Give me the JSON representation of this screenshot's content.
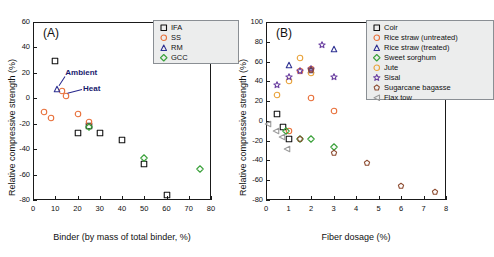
{
  "figure": {
    "panels": [
      {
        "id": "A",
        "label": "(A)",
        "xlabel": "Binder (by mass of total binder, %)",
        "ylabel": "Relative compressive strength (%)",
        "xlim": [
          0,
          80
        ],
        "ylim": [
          -80,
          60
        ],
        "xticks": [
          0,
          10,
          20,
          30,
          40,
          50,
          60,
          70,
          80
        ],
        "yticks": [
          -80,
          -60,
          -40,
          -20,
          0,
          20,
          40,
          60
        ],
        "annotations": [
          {
            "text": "Ambient",
            "x": 14.5,
            "y": 20.0
          },
          {
            "text": "Heat",
            "x": 22.5,
            "y": 7.0
          }
        ],
        "legend": [
          {
            "label": "IFA",
            "marker": "square",
            "color": "#111111"
          },
          {
            "label": "SS",
            "marker": "circle",
            "color": "#E8703A"
          },
          {
            "label": "RM",
            "marker": "triangle",
            "color": "#2E3192"
          },
          {
            "label": "GCC",
            "marker": "diamond",
            "color": "#3DA23D"
          }
        ]
      },
      {
        "id": "B",
        "label": "(B)",
        "xlabel": "Fiber dosage (%)",
        "ylabel": "Relative compressive strength (%)",
        "xlim": [
          0,
          8
        ],
        "ylim": [
          -80,
          100
        ],
        "xticks": [
          0,
          1,
          2,
          3,
          4,
          5,
          6,
          7,
          8
        ],
        "yticks": [
          -80,
          -60,
          -40,
          -20,
          0,
          20,
          40,
          60,
          80,
          100
        ],
        "annotations": [],
        "legend": [
          {
            "label": "Coir",
            "marker": "square",
            "color": "#111111"
          },
          {
            "label": "Rice straw (untreated)",
            "marker": "circle",
            "color": "#E8703A"
          },
          {
            "label": "Rice straw (treated)",
            "marker": "triangle",
            "color": "#2E3192"
          },
          {
            "label": "Sweet sorghum",
            "marker": "diamond",
            "color": "#3DA23D"
          },
          {
            "label": "Jute",
            "marker": "circle",
            "color": "#E9A33C"
          },
          {
            "label": "Sisal",
            "marker": "star",
            "color": "#6A3FA0"
          },
          {
            "label": "Sugarcane bagasse",
            "marker": "pentagon",
            "color": "#8C4A2F"
          },
          {
            "label": "Flax tow",
            "marker": "triangle-left",
            "color": "#9A9A9A"
          }
        ]
      }
    ]
  },
  "chart_data": [
    {
      "type": "scatter",
      "panel": "A",
      "title": "(A)",
      "xlabel": "Binder (by mass of total binder, %)",
      "ylabel": "Relative compressive strength (%)",
      "xlim": [
        0,
        80
      ],
      "ylim": [
        -80,
        60
      ],
      "xticks": [
        0,
        10,
        20,
        30,
        40,
        50,
        60,
        70,
        80
      ],
      "yticks": [
        -80,
        -60,
        -40,
        -20,
        0,
        20,
        40,
        60
      ],
      "grid": false,
      "legend_position": "top-right",
      "series": [
        {
          "name": "IFA",
          "marker": "square",
          "color": "#111111",
          "points": [
            {
              "x": 10,
              "y": 29
            },
            {
              "x": 20,
              "y": -27.5
            },
            {
              "x": 25,
              "y": -22
            },
            {
              "x": 30,
              "y": -27.5
            },
            {
              "x": 40,
              "y": -33
            },
            {
              "x": 50,
              "y": -52
            },
            {
              "x": 60,
              "y": -76
            }
          ]
        },
        {
          "name": "SS",
          "marker": "circle",
          "color": "#E8703A",
          "points": [
            {
              "x": 5,
              "y": -10.5
            },
            {
              "x": 8,
              "y": -15.5
            },
            {
              "x": 15,
              "y": 2
            },
            {
              "x": 20,
              "y": -12
            },
            {
              "x": 25,
              "y": -19
            },
            {
              "x": 13,
              "y": 6
            }
          ]
        },
        {
          "name": "RM",
          "marker": "triangle",
          "color": "#2E3192",
          "points": [
            {
              "x": 11,
              "y": 7
            }
          ]
        },
        {
          "name": "GCC",
          "marker": "diamond",
          "color": "#3DA23D",
          "points": [
            {
              "x": 25,
              "y": -22.5
            },
            {
              "x": 50,
              "y": -47
            },
            {
              "x": 75,
              "y": -56
            }
          ]
        }
      ],
      "annotations": [
        {
          "text": "Ambient",
          "x": 14.5,
          "y": 20.0
        },
        {
          "text": "Heat",
          "x": 22.5,
          "y": 7.0
        }
      ]
    },
    {
      "type": "scatter",
      "panel": "B",
      "title": "(B)",
      "xlabel": "Fiber dosage (%)",
      "ylabel": "Relative compressive strength (%)",
      "xlim": [
        0,
        8
      ],
      "ylim": [
        -80,
        100
      ],
      "xticks": [
        0,
        1,
        2,
        3,
        4,
        5,
        6,
        7,
        8
      ],
      "yticks": [
        -80,
        -60,
        -40,
        -20,
        0,
        20,
        40,
        60,
        80,
        100
      ],
      "grid": false,
      "legend_position": "top-right",
      "series": [
        {
          "name": "Coir",
          "marker": "square",
          "color": "#111111",
          "points": [
            {
              "x": 0.5,
              "y": 7
            },
            {
              "x": 0.75,
              "y": -6
            },
            {
              "x": 1.0,
              "y": -18
            }
          ]
        },
        {
          "name": "Rice straw (untreated)",
          "marker": "circle",
          "color": "#E8703A",
          "points": [
            {
              "x": 1.5,
              "y": 50
            },
            {
              "x": 2.0,
              "y": 52
            },
            {
              "x": 2.0,
              "y": 23
            },
            {
              "x": 3.0,
              "y": 9.5
            },
            {
              "x": 1.0,
              "y": -10
            }
          ]
        },
        {
          "name": "Rice straw (treated)",
          "marker": "triangle",
          "color": "#2E3192",
          "points": [
            {
              "x": 1.0,
              "y": 57
            },
            {
              "x": 2.0,
              "y": 51
            },
            {
              "x": 3.0,
              "y": 73
            }
          ]
        },
        {
          "name": "Sweet sorghum",
          "marker": "diamond",
          "color": "#3DA23D",
          "points": [
            {
              "x": 0.9,
              "y": -10
            },
            {
              "x": 1.5,
              "y": -18
            },
            {
              "x": 2.0,
              "y": -18
            },
            {
              "x": 3.0,
              "y": -26
            }
          ]
        },
        {
          "name": "Jute",
          "marker": "circle",
          "color": "#E9A33C",
          "points": [
            {
              "x": 0.5,
              "y": 26
            },
            {
              "x": 1.0,
              "y": 40
            },
            {
              "x": 1.5,
              "y": 64
            },
            {
              "x": 2.0,
              "y": 48
            }
          ]
        },
        {
          "name": "Sisal",
          "marker": "star",
          "color": "#6A3FA0",
          "points": [
            {
              "x": 0.5,
              "y": 36
            },
            {
              "x": 1.0,
              "y": 44
            },
            {
              "x": 1.5,
              "y": 50
            },
            {
              "x": 2.0,
              "y": 52
            },
            {
              "x": 2.5,
              "y": 77
            },
            {
              "x": 3.0,
              "y": 44
            }
          ]
        },
        {
          "name": "Sugarcane bagasse",
          "marker": "pentagon",
          "color": "#8C4A2F",
          "points": [
            {
              "x": 2.0,
              "y": 51
            },
            {
              "x": 1.5,
              "y": -18
            },
            {
              "x": 3.0,
              "y": -32
            },
            {
              "x": 4.5,
              "y": -43
            },
            {
              "x": 6.0,
              "y": -66
            },
            {
              "x": 7.5,
              "y": -72
            }
          ]
        },
        {
          "name": "Flax tow",
          "marker": "triangle-left",
          "color": "#9A9A9A",
          "points": [
            {
              "x": 0.1,
              "y": -3
            },
            {
              "x": 0.45,
              "y": -10
            },
            {
              "x": 0.7,
              "y": -16
            },
            {
              "x": 0.95,
              "y": -28
            }
          ]
        }
      ],
      "annotations": []
    }
  ]
}
